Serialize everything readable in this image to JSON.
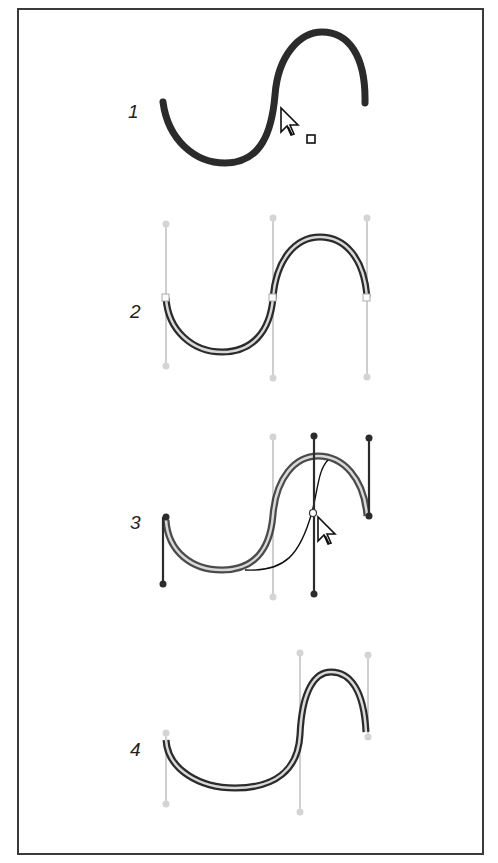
{
  "figure": {
    "steps": [
      {
        "label": "1",
        "caption_state": "curve clicked with direct selection cursor"
      },
      {
        "label": "2",
        "caption_state": "anchor points and handles displayed"
      },
      {
        "label": "3",
        "caption_state": "dragging a curve segment adjusts handles"
      },
      {
        "label": "4",
        "caption_state": "resulting reshaped curve"
      }
    ]
  },
  "colors": {
    "frame": "#3a3a3a",
    "stroke": "#2b2b2b",
    "outline_inner": "#d9d9d9",
    "handle_inactive": "#cfcfcf",
    "handle_active": "#2b2b2b"
  }
}
